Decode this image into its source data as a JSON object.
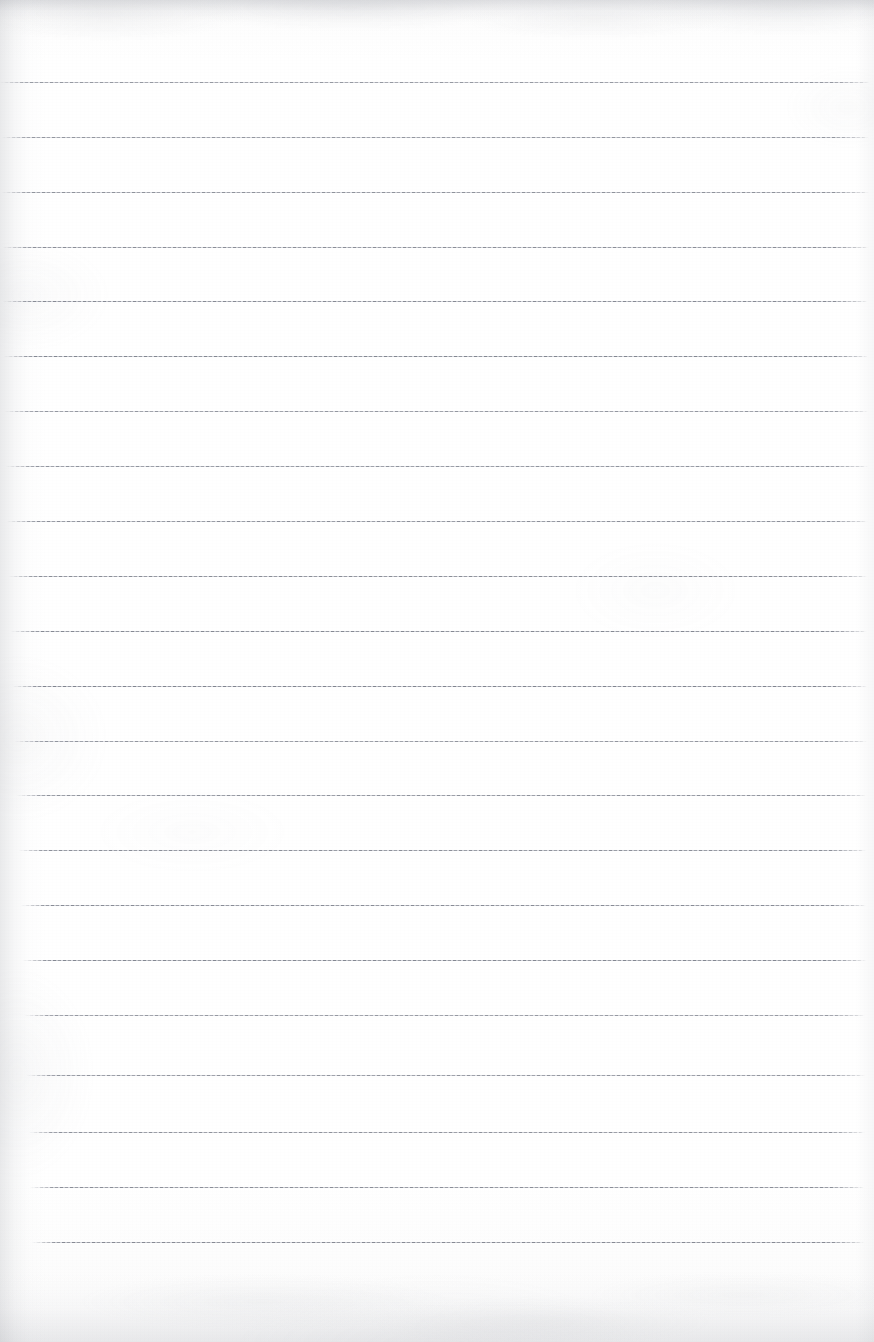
{
  "document": {
    "kind": "scanned-ruled-paper",
    "title": "Blank ruled notebook page",
    "page_width": 874,
    "page_height": 1342,
    "orientation": "portrait",
    "text_content": "",
    "handwriting_present": false,
    "margin_rule_present": false,
    "hole_punches_present": false
  },
  "colors": {
    "paper": "#ffffff",
    "paper_tint_top": "#f7f7f8",
    "paper_tint_bottom": "#f6f6f7",
    "rule_line": "#70757f",
    "rule_line_light": "#969ba5",
    "scan_shadow": "#9295a0"
  },
  "ruling": {
    "line_count": 22,
    "first_line_y": 82,
    "line_spacing": 55,
    "line_thickness": 1,
    "style": "solid-faint-dotted",
    "lines": [
      {
        "y": 82,
        "left": 0,
        "right": 870
      },
      {
        "y": 137,
        "left": 2,
        "right": 869
      },
      {
        "y": 192,
        "left": 2,
        "right": 869
      },
      {
        "y": 247,
        "left": 3,
        "right": 869
      },
      {
        "y": 301,
        "left": 3,
        "right": 868
      },
      {
        "y": 356,
        "left": 4,
        "right": 868
      },
      {
        "y": 411,
        "left": 5,
        "right": 868
      },
      {
        "y": 466,
        "left": 6,
        "right": 868
      },
      {
        "y": 521,
        "left": 7,
        "right": 868
      },
      {
        "y": 576,
        "left": 9,
        "right": 867
      },
      {
        "y": 631,
        "left": 11,
        "right": 867
      },
      {
        "y": 686,
        "left": 13,
        "right": 867
      },
      {
        "y": 741,
        "left": 15,
        "right": 867
      },
      {
        "y": 795,
        "left": 17,
        "right": 866
      },
      {
        "y": 850,
        "left": 19,
        "right": 866
      },
      {
        "y": 905,
        "left": 21,
        "right": 866
      },
      {
        "y": 960,
        "left": 23,
        "right": 866
      },
      {
        "y": 1015,
        "left": 25,
        "right": 865
      },
      {
        "y": 1075,
        "left": 27,
        "right": 865
      },
      {
        "y": 1132,
        "left": 29,
        "right": 865
      },
      {
        "y": 1187,
        "left": 30,
        "right": 864
      },
      {
        "y": 1242,
        "left": 32,
        "right": 864
      }
    ]
  },
  "blank_zones": {
    "header_margin_height": 82,
    "footer_margin_height": 100
  }
}
